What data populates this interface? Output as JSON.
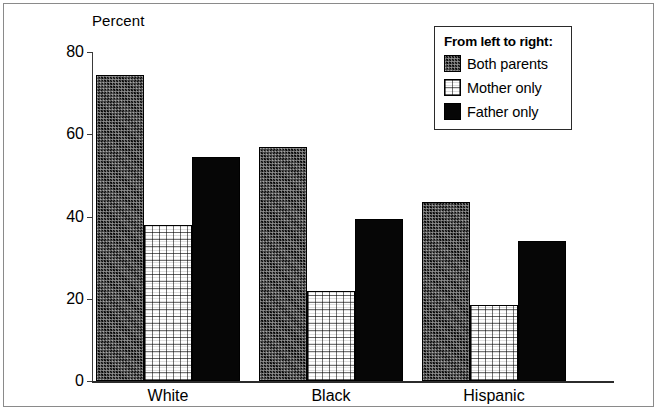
{
  "chart_data": {
    "type": "bar",
    "title": "",
    "ylabel": "Percent",
    "xlabel": "",
    "categories": [
      "White",
      "Black",
      "Hispanic"
    ],
    "series": [
      {
        "name": "Both parents",
        "pattern": "dark-dither",
        "values": [
          74.5,
          57.0,
          43.5
        ]
      },
      {
        "name": "Mother only",
        "pattern": "light-grid",
        "values": [
          38.0,
          22.0,
          18.5
        ]
      },
      {
        "name": "Father only",
        "pattern": "solid-black",
        "values": [
          54.5,
          39.5,
          34.0
        ]
      }
    ],
    "ylim": [
      0,
      80
    ],
    "yticks": [
      0,
      20,
      40,
      60,
      80
    ],
    "ytick_labels": [
      "0",
      "20",
      "40",
      "60",
      "80"
    ],
    "grid": false,
    "legend_position": "top-right"
  },
  "legend": {
    "title": "From left to right:",
    "entries": [
      {
        "label": "Both parents"
      },
      {
        "label": "Mother only"
      },
      {
        "label": "Father only"
      }
    ]
  },
  "axis": {
    "y_title": "Percent"
  },
  "colors": {
    "frame": "#8a8a8a",
    "axis": "#2b2b2b",
    "both_parents": "#111111",
    "mother_only": "#ffffff",
    "father_only": "#060606",
    "background": "#ffffff"
  }
}
